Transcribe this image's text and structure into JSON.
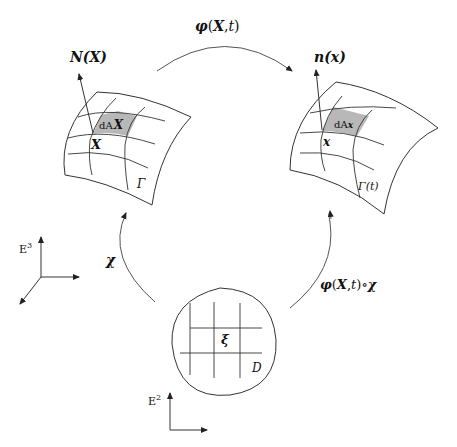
{
  "diagram": {
    "labels": {
      "phi_map": "φ(X,t)",
      "phi_map_bold": "X",
      "normal_ref": "N(X)",
      "normal_cur": "n(x)",
      "dA_ref": "dA",
      "dA_ref_sub": "X",
      "dA_cur": "dA",
      "dA_cur_sub": "x",
      "point_ref": "X",
      "point_cur": "x",
      "surface_ref": "Γ",
      "surface_cur": "Γ(t)",
      "chi_map": "χ",
      "composite_map": "φ(X,t)∘χ",
      "param_point": "ξ",
      "param_domain": "D",
      "space3": "E",
      "space3_sup": "3",
      "space2": "E",
      "space2_sup": "2"
    },
    "colors": {
      "stroke": "#222222",
      "shaded_patch": "#b8b8b8",
      "background": "#ffffff"
    }
  }
}
